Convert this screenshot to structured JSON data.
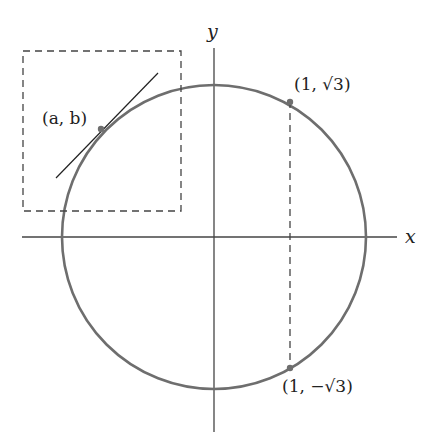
{
  "diagram": {
    "axes": {
      "x_label": "x",
      "y_label": "y"
    },
    "circle": {
      "center": [
        0,
        0
      ],
      "radius": 2,
      "color": "#6e6e6e"
    },
    "points": [
      {
        "id": "ab",
        "label": "(a, b)"
      },
      {
        "id": "p_top",
        "label": "(1, √3)"
      },
      {
        "id": "p_bottom",
        "label": "(1, −√3)"
      }
    ],
    "annotations": {
      "dashed_box": "zoom region around (a, b)",
      "tangent_line": "tangent at (a, b)",
      "dashed_vertical": "x = 1 between (1, √3) and (1, −√3)"
    }
  }
}
